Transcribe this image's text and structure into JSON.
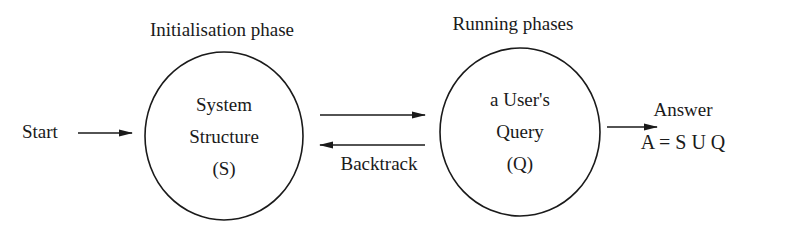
{
  "phases": {
    "init_label": "Initialisation phase",
    "running_label": "Running phases"
  },
  "nodes": {
    "system": {
      "lines": [
        "System",
        "Structure",
        "(S)"
      ]
    },
    "query": {
      "lines": [
        "a User's",
        "Query",
        "(Q)"
      ]
    }
  },
  "labels": {
    "start": "Start",
    "backtrack": "Backtrack",
    "answer": "Answer",
    "answer_formula": "A = S U Q"
  },
  "colors": {
    "ink": "#1a1a1a",
    "background": "#ffffff"
  }
}
